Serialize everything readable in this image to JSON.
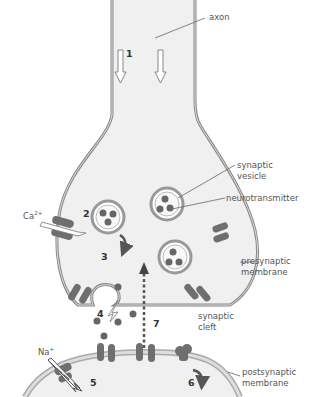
{
  "colors": {
    "cell_fill": "#f0f0f0",
    "membrane": "#8a8a8a",
    "membrane_inner": "#d4d4d4",
    "channel": "#6f6f6f",
    "neurotransmitter": "#666666",
    "label_text": "#555555",
    "number_text": "#333333"
  },
  "labels": {
    "axon": "axon",
    "synaptic_vesicle_line1": "synaptic",
    "synaptic_vesicle_line2": "vesicle",
    "neurotransmitter": "neurotransmitter",
    "presynaptic_line1": "presynaptic",
    "presynaptic_line2": "membrane",
    "cleft_line1": "synaptic",
    "cleft_line2": "cleft",
    "postsynaptic_line1": "postsynaptic",
    "postsynaptic_line2": "membrane"
  },
  "ions": {
    "calcium": "Ca",
    "calcium_charge": "2+",
    "sodium": "Na",
    "sodium_charge": "+"
  },
  "steps": [
    "1",
    "2",
    "3",
    "4",
    "5",
    "6",
    "7"
  ]
}
